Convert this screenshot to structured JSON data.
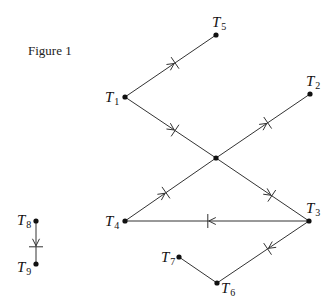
{
  "figure": {
    "title": "Figure 1"
  },
  "nodes": [
    {
      "id": "T1",
      "letter": "T",
      "sub": "1",
      "x": 125,
      "y": 97,
      "label_dx": -20,
      "label_dy": 5
    },
    {
      "id": "T2",
      "letter": "T",
      "sub": "2",
      "x": 310,
      "y": 94,
      "label_dx": -4,
      "label_dy": -8
    },
    {
      "id": "T3",
      "letter": "T",
      "sub": "3",
      "x": 309,
      "y": 221,
      "label_dx": -3,
      "label_dy": -8
    },
    {
      "id": "T4",
      "letter": "T",
      "sub": "4",
      "x": 125,
      "y": 221,
      "label_dx": -20,
      "label_dy": 5
    },
    {
      "id": "T5",
      "letter": "T",
      "sub": "5",
      "x": 216,
      "y": 35,
      "label_dx": -4,
      "label_dy": -8
    },
    {
      "id": "T6",
      "letter": "T",
      "sub": "6",
      "x": 217,
      "y": 283,
      "label_dx": 4,
      "label_dy": 10
    },
    {
      "id": "T7",
      "letter": "T",
      "sub": "7",
      "x": 179,
      "y": 257,
      "label_dx": -18,
      "label_dy": 5
    },
    {
      "id": "T8",
      "letter": "T",
      "sub": "8",
      "x": 36,
      "y": 221,
      "label_dx": -19,
      "label_dy": 4
    },
    {
      "id": "T9",
      "letter": "T",
      "sub": "9",
      "x": 36,
      "y": 264,
      "label_dx": -19,
      "label_dy": 8
    },
    {
      "id": "C",
      "letter": "",
      "sub": "",
      "x": 216,
      "y": 158,
      "label_dx": 0,
      "label_dy": 0
    }
  ],
  "edges": [
    {
      "from": "T1",
      "to": "T5",
      "marker": "arrow-cross",
      "pos": 0.55
    },
    {
      "from": "T1",
      "to": "C",
      "marker": "arrow-cross",
      "pos": 0.55
    },
    {
      "from": "T4",
      "to": "C",
      "marker": "arrow-cross",
      "pos": 0.45
    },
    {
      "from": "C",
      "to": "T2",
      "marker": "arrow-cross",
      "pos": 0.55
    },
    {
      "from": "C",
      "to": "T3",
      "marker": "arrow-cross",
      "pos": 0.6
    },
    {
      "from": "T3",
      "to": "T4",
      "marker": "arrow-cross",
      "pos": 0.55
    },
    {
      "from": "T3",
      "to": "T6",
      "marker": "arrow-cross",
      "pos": 0.45
    },
    {
      "from": "T7",
      "to": "T6",
      "marker": "none",
      "pos": 0.5
    },
    {
      "from": "T8",
      "to": "T9",
      "marker": "arrow-cross",
      "pos": 0.6
    }
  ]
}
